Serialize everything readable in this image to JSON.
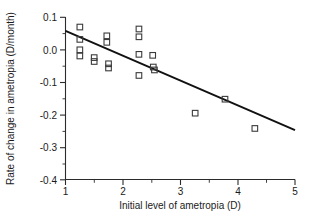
{
  "chart_data": {
    "type": "scatter",
    "title": "",
    "xlabel": "Initial level of ametropia (D)",
    "ylabel": "Rate of change in ametropia (D/month)",
    "xlim": [
      1,
      5
    ],
    "ylim": [
      -0.4,
      0.1
    ],
    "xticks": [
      1,
      2,
      3,
      4,
      5
    ],
    "xtick_labels": [
      "1",
      "2",
      "3",
      "4",
      "5"
    ],
    "yticks": [
      0.1,
      0.0,
      -0.1,
      -0.2,
      -0.3,
      -0.4
    ],
    "ytick_labels": [
      "0.1",
      "0.0",
      "-0.1",
      "-0.2",
      "-0.3",
      "-0.4"
    ],
    "x_minor_ticks": [
      1.25,
      1.5,
      1.75,
      2.25,
      2.5,
      2.75,
      3.25,
      3.5,
      3.75,
      4.25,
      4.5,
      4.75
    ],
    "y_minor_ticks": [
      0.05,
      -0.05,
      -0.15,
      -0.25,
      -0.35
    ],
    "grid": false,
    "legend": null,
    "marker_style": "open-square",
    "points": [
      {
        "x": 1.25,
        "y": 0.07
      },
      {
        "x": 1.25,
        "y": 0.032
      },
      {
        "x": 1.25,
        "y": 0.0
      },
      {
        "x": 1.25,
        "y": -0.019
      },
      {
        "x": 1.5,
        "y": -0.024
      },
      {
        "x": 1.5,
        "y": -0.036
      },
      {
        "x": 1.72,
        "y": 0.043
      },
      {
        "x": 1.72,
        "y": 0.023
      },
      {
        "x": 1.75,
        "y": -0.043
      },
      {
        "x": 1.75,
        "y": -0.056
      },
      {
        "x": 2.28,
        "y": 0.064
      },
      {
        "x": 2.28,
        "y": 0.04
      },
      {
        "x": 2.28,
        "y": -0.014
      },
      {
        "x": 2.28,
        "y": -0.079
      },
      {
        "x": 2.52,
        "y": -0.017
      },
      {
        "x": 2.53,
        "y": -0.053
      },
      {
        "x": 2.55,
        "y": -0.062
      },
      {
        "x": 3.26,
        "y": -0.195
      },
      {
        "x": 3.78,
        "y": -0.152
      },
      {
        "x": 4.3,
        "y": -0.242
      }
    ],
    "fit_line": {
      "type": "linear-regression",
      "x_start": 1.0,
      "y_start": 0.058,
      "x_end": 5.0,
      "y_end": -0.247,
      "slope": -0.0763,
      "intercept": 0.1343
    }
  }
}
